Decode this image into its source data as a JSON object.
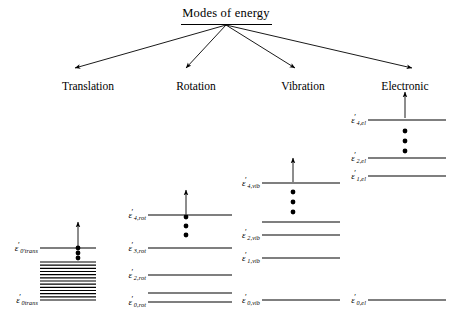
{
  "diagram": {
    "title": "Modes of energy",
    "type": "energy-level-diagram"
  },
  "branches": [
    {
      "id": "translation",
      "label": "Translation",
      "label_x": 88,
      "label_y": 80
    },
    {
      "id": "rotation",
      "label": "Rotation",
      "label_x": 196,
      "label_y": 80
    },
    {
      "id": "vibration",
      "label": "Vibration",
      "label_x": 303,
      "label_y": 80
    },
    {
      "id": "electronic",
      "label": "Electronic",
      "label_x": 405,
      "label_y": 80
    }
  ],
  "levels": {
    "translation": {
      "x_start": 40,
      "x_end": 96,
      "arrow": {
        "x": 78,
        "y_top": 222,
        "y_bottom": 246
      },
      "dots": {
        "x": 78,
        "ys": [
          248,
          253,
          258
        ]
      },
      "labeled": [
        {
          "symbol": "ε",
          "prime": "′",
          "sub": "0′trans",
          "sub_text": "0′trans",
          "y": 248,
          "label_x": 38
        },
        {
          "symbol": "ε",
          "prime": "′",
          "sub": "0trans",
          "sub_text": "0trans",
          "y": 300,
          "label_x": 38
        }
      ],
      "ladder": {
        "y_top": 262,
        "y_bottom": 300,
        "count": 13
      }
    },
    "rotation": {
      "x_start": 148,
      "x_end": 232,
      "arrow": {
        "x": 186,
        "y_top": 190,
        "y_bottom": 214
      },
      "dots": {
        "x": 186,
        "ys": [
          217,
          226,
          235
        ]
      },
      "lines": [
        {
          "y": 215,
          "label": "ε",
          "sub_text": "4,rot",
          "label_x": 146
        },
        {
          "y": 248,
          "label": "ε",
          "sub_text": "3,rot",
          "label_x": 146
        },
        {
          "y": 275,
          "label": "ε",
          "sub_text": "2,rot",
          "label_x": 146
        },
        {
          "y": 293,
          "label": "",
          "sub_text": "",
          "label_x": 146
        },
        {
          "y": 302,
          "label": "ε",
          "sub_text": "0,rot",
          "label_x": 146
        }
      ]
    },
    "vibration": {
      "x_start": 262,
      "x_end": 340,
      "arrow": {
        "x": 293,
        "y_top": 158,
        "y_bottom": 182
      },
      "dots": {
        "x": 293,
        "ys": [
          192,
          202,
          212
        ]
      },
      "lines": [
        {
          "y": 183,
          "label": "ε",
          "sub_text": "4,vib",
          "label_x": 260
        },
        {
          "y": 222,
          "label": "",
          "sub_text": "",
          "label_x": 260
        },
        {
          "y": 235,
          "label": "ε",
          "sub_text": "2,vib",
          "label_x": 260
        },
        {
          "y": 258,
          "label": "ε",
          "sub_text": "1,vib",
          "label_x": 260
        },
        {
          "y": 300,
          "label": "ε",
          "sub_text": "0,vib",
          "label_x": 260
        }
      ]
    },
    "electronic": {
      "x_start": 368,
      "x_end": 446,
      "arrow": {
        "x": 405,
        "y_top": 92,
        "y_bottom": 118
      },
      "dots": {
        "x": 405,
        "ys": [
          131,
          141,
          151
        ]
      },
      "lines": [
        {
          "y": 120,
          "label": "ε",
          "sub_text": "4,el",
          "label_x": 366
        },
        {
          "y": 158,
          "label": "ε",
          "sub_text": "2,el",
          "label_x": 366
        },
        {
          "y": 176,
          "label": "ε",
          "sub_text": "1,el",
          "label_x": 366
        },
        {
          "y": 300,
          "label": "ε",
          "sub_text": "0,el",
          "label_x": 366
        }
      ]
    }
  },
  "title_arrows": {
    "origin_x": 226,
    "origin_y": 25,
    "targets": [
      {
        "x": 75,
        "y": 68
      },
      {
        "x": 186,
        "y": 68
      },
      {
        "x": 295,
        "y": 68
      },
      {
        "x": 412,
        "y": 68
      }
    ]
  },
  "style": {
    "line_color": "#000000",
    "background": "#ffffff"
  }
}
